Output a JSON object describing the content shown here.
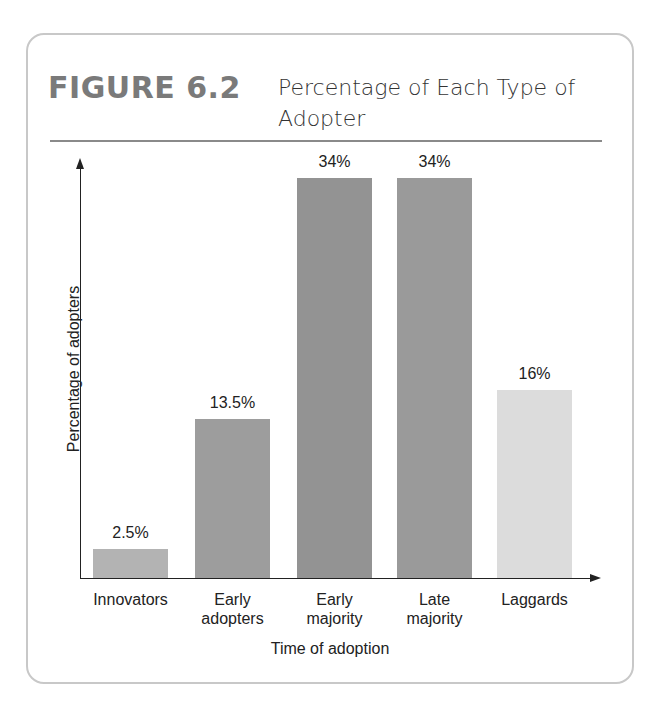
{
  "figure": {
    "number": "FIGURE 6.2",
    "title": "Percentage of Each Type of Adopter"
  },
  "chart_data": {
    "type": "bar",
    "title": "Percentage of Each Type of Adopter",
    "xlabel": "Time of adoption",
    "ylabel": "Percentage of adopters",
    "categories": [
      "Innovators",
      "Early adopters",
      "Early majority",
      "Late majority",
      "Laggards"
    ],
    "category_lines": [
      [
        "Innovators"
      ],
      [
        "Early",
        "adopters"
      ],
      [
        "Early",
        "majority"
      ],
      [
        "Late",
        "majority"
      ],
      [
        "Laggards"
      ]
    ],
    "values": [
      2.5,
      13.5,
      34,
      34,
      16
    ],
    "value_labels": [
      "2.5%",
      "13.5%",
      "34%",
      "34%",
      "16%"
    ],
    "colors": [
      "#b3b3b3",
      "#9d9d9d",
      "#939393",
      "#9a9a9a",
      "#dcdcdc"
    ],
    "ylim": [
      0,
      36
    ],
    "grid": false,
    "legend": "none",
    "y_ticks": "none"
  }
}
